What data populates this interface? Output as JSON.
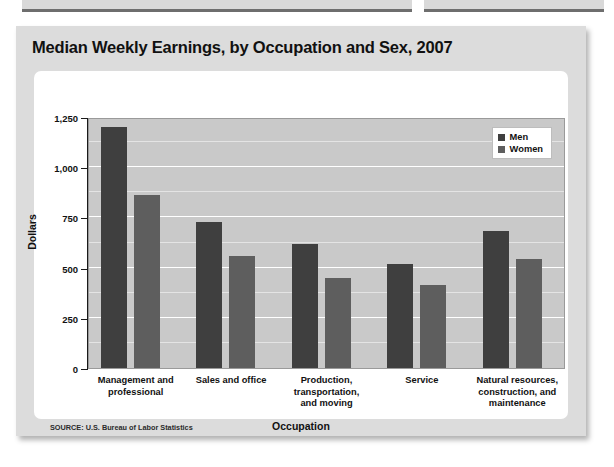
{
  "figure": {
    "title": "Median Weekly Earnings, by Occupation and Sex, 2007",
    "source": "SOURCE: U.S. Bureau of Labor Statistics"
  },
  "legend": {
    "position": "top-right",
    "entries": [
      {
        "label": "Men",
        "color": "#3f3f3f"
      },
      {
        "label": "Women",
        "color": "#5e5e5e"
      }
    ]
  },
  "axes": {
    "y_title": "Dollars",
    "x_title": "Occupation",
    "y_ticks": [
      "1,250",
      "1,000",
      "750",
      "500",
      "250",
      "0"
    ]
  },
  "chart_data": {
    "type": "bar",
    "title": "Median Weekly Earnings, by Occupation and Sex, 2007",
    "xlabel": "Occupation",
    "ylabel": "Dollars",
    "ylim": [
      0,
      1250
    ],
    "ytick_values": [
      0,
      250,
      500,
      750,
      1000,
      1250
    ],
    "grid": true,
    "minor_gridlines": true,
    "legend_position": "top-right",
    "categories": [
      "Management and professional",
      "Sales and office",
      "Production, transportation, and moving",
      "Service",
      "Natural resources, construction, and maintenance"
    ],
    "category_lines": [
      [
        "Management and",
        "professional"
      ],
      [
        "Sales and office"
      ],
      [
        "Production,",
        "transportation,",
        "and moving"
      ],
      [
        "Service"
      ],
      [
        "Natural resources,",
        "construction, and",
        "maintenance"
      ]
    ],
    "series": [
      {
        "name": "Men",
        "color": "#3f3f3f",
        "values": [
          1200,
          725,
          620,
          520,
          680
        ]
      },
      {
        "name": "Women",
        "color": "#5e5e5e",
        "values": [
          860,
          560,
          450,
          415,
          545
        ]
      }
    ]
  }
}
